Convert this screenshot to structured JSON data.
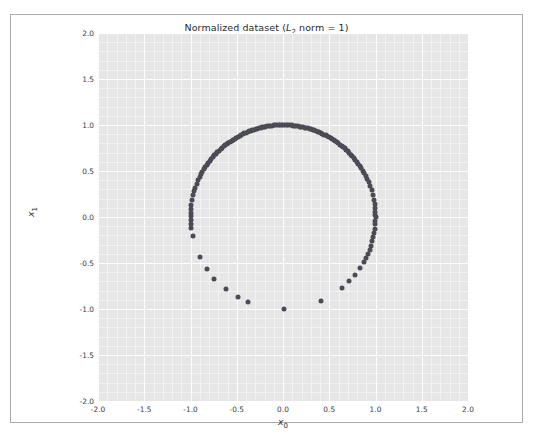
{
  "figure": {
    "background_color": "#ffffff",
    "border_color": "#aaaaac",
    "width": 533,
    "height": 433
  },
  "chart_data": {
    "type": "scatter",
    "title": "Normalized dataset (L2 norm = 1)",
    "title_parts": {
      "prefix": "Normalized dataset (",
      "italic_symbol": "L",
      "subscript": "2",
      "suffix": " norm = 1)"
    },
    "xlabel": "x0",
    "xlabel_parts": {
      "italic_symbol": "x",
      "subscript": "0"
    },
    "ylabel": "x1",
    "ylabel_parts": {
      "italic_symbol": "x",
      "subscript": "1"
    },
    "xlim": [
      -2.0,
      2.0
    ],
    "ylim": [
      -2.0,
      2.0
    ],
    "xticks": [
      -2.0,
      -1.5,
      -1.0,
      -0.5,
      0.0,
      0.5,
      1.0,
      1.5,
      2.0
    ],
    "yticks": [
      -2.0,
      -1.5,
      -1.0,
      -0.5,
      0.0,
      0.5,
      1.0,
      1.5,
      2.0
    ],
    "xtick_labels": [
      "-2.0",
      "-1.5",
      "-1.0",
      "-0.5",
      "0.0",
      "0.5",
      "1.0",
      "1.5",
      "2.0"
    ],
    "ytick_labels": [
      "-2.0",
      "-1.5",
      "-1.0",
      "-0.5",
      "0.0",
      "0.5",
      "1.0",
      "1.5",
      "2.0"
    ],
    "grid": true,
    "grid_color": "#ffffff",
    "minor_grid": true,
    "minor_grid_color": "#f2f2f2",
    "axes_facecolor": "#e6e6e6",
    "legend": null,
    "marker_color": "#4b4b55",
    "marker_size": 5,
    "aspect": "equal",
    "points": [
      [
        0.0043,
        1.0
      ],
      [
        0.0218,
        0.9998
      ],
      [
        0.0395,
        0.9992
      ],
      [
        0.0571,
        0.9984
      ],
      [
        0.0749,
        0.9972
      ],
      [
        0.0925,
        0.9957
      ],
      [
        0.1102,
        0.9939
      ],
      [
        0.1279,
        0.9918
      ],
      [
        -0.0131,
        0.9999
      ],
      [
        -0.0306,
        0.9995
      ],
      [
        -0.0483,
        0.9988
      ],
      [
        -0.066,
        0.9978
      ],
      [
        -0.0837,
        0.9965
      ],
      [
        -0.1013,
        0.9949
      ],
      [
        -0.119,
        0.9929
      ],
      [
        -0.1367,
        0.9906
      ],
      [
        0.1455,
        0.9894
      ],
      [
        0.1632,
        0.9866
      ],
      [
        0.1808,
        0.9835
      ],
      [
        0.1985,
        0.9801
      ],
      [
        0.2161,
        0.9764
      ],
      [
        0.2338,
        0.9723
      ],
      [
        0.2514,
        0.9679
      ],
      [
        0.269,
        0.9632
      ],
      [
        -0.1543,
        0.988
      ],
      [
        -0.172,
        0.9851
      ],
      [
        -0.1896,
        0.9819
      ],
      [
        -0.2073,
        0.9783
      ],
      [
        -0.2249,
        0.9744
      ],
      [
        -0.2425,
        0.9702
      ],
      [
        -0.2601,
        0.9656
      ],
      [
        -0.2777,
        0.9607
      ],
      [
        0.2866,
        0.958
      ],
      [
        0.3042,
        0.9526
      ],
      [
        0.3217,
        0.9469
      ],
      [
        0.3393,
        0.9407
      ],
      [
        0.3568,
        0.9342
      ],
      [
        0.3743,
        0.9273
      ],
      [
        0.3918,
        0.92
      ],
      [
        0.4093,
        0.9124
      ],
      [
        -0.2953,
        0.9554
      ],
      [
        -0.3129,
        0.9498
      ],
      [
        -0.3305,
        0.9438
      ],
      [
        -0.348,
        0.9375
      ],
      [
        -0.3655,
        0.9308
      ],
      [
        -0.383,
        0.9238
      ],
      [
        -0.4005,
        0.9163
      ],
      [
        -0.418,
        0.9085
      ],
      [
        0.4267,
        0.9044
      ],
      [
        0.4441,
        0.896
      ],
      [
        0.4615,
        0.8871
      ],
      [
        0.4789,
        0.8779
      ],
      [
        0.4962,
        0.8682
      ],
      [
        0.5135,
        0.8581
      ],
      [
        0.5308,
        0.8475
      ],
      [
        0.548,
        0.8365
      ],
      [
        -0.4354,
        0.9003
      ],
      [
        -0.4528,
        0.8916
      ],
      [
        -0.4701,
        0.8826
      ],
      [
        -0.4874,
        0.8732
      ],
      [
        -0.5047,
        0.8633
      ],
      [
        -0.5219,
        0.853
      ],
      [
        -0.5391,
        0.8423
      ],
      [
        -0.5563,
        0.8311
      ],
      [
        0.5652,
        0.825
      ],
      [
        0.5823,
        0.813
      ],
      [
        0.5994,
        0.8005
      ],
      [
        0.6164,
        0.7875
      ],
      [
        0.6334,
        0.7739
      ],
      [
        0.6503,
        0.7597
      ],
      [
        0.6672,
        0.745
      ],
      [
        0.684,
        0.7295
      ],
      [
        -0.5734,
        0.8192
      ],
      [
        -0.5905,
        0.807
      ],
      [
        -0.6075,
        0.7943
      ],
      [
        -0.6245,
        0.781
      ],
      [
        -0.6414,
        0.7671
      ],
      [
        -0.6583,
        0.7528
      ],
      [
        -0.6751,
        0.7377
      ],
      [
        -0.6918,
        0.7221
      ],
      [
        0.7008,
        0.7134
      ],
      [
        0.7175,
        0.6966
      ],
      [
        0.7341,
        0.679
      ],
      [
        0.7506,
        0.6608
      ],
      [
        0.7671,
        0.6416
      ],
      [
        0.7835,
        0.6214
      ],
      [
        0.7998,
        0.6003
      ],
      [
        0.816,
        0.5781
      ],
      [
        -0.7085,
        0.7057
      ],
      [
        -0.7251,
        0.6887
      ],
      [
        -0.7417,
        0.6707
      ],
      [
        -0.7582,
        0.652
      ],
      [
        -0.7746,
        0.6324
      ],
      [
        -0.7909,
        0.612
      ],
      [
        -0.8071,
        0.5904
      ],
      [
        -0.8232,
        0.5678
      ],
      [
        0.8322,
        0.5545
      ],
      [
        0.8483,
        0.5295
      ],
      [
        0.8643,
        0.5029
      ],
      [
        0.8801,
        0.4748
      ],
      [
        0.8958,
        0.4444
      ],
      [
        0.9114,
        0.4115
      ],
      [
        0.9268,
        0.3755
      ],
      [
        0.942,
        0.3356
      ],
      [
        -0.8393,
        0.5437
      ],
      [
        -0.8552,
        0.5183
      ],
      [
        -0.871,
        0.4913
      ],
      [
        -0.8867,
        0.4624
      ],
      [
        -0.9022,
        0.4313
      ],
      [
        -0.9175,
        0.3977
      ],
      [
        -0.9327,
        0.3607
      ],
      [
        -0.9477,
        0.3192
      ],
      [
        0.9571,
        0.2898
      ],
      [
        0.971,
        0.2391
      ],
      [
        0.9823,
        0.1873
      ],
      [
        0.9905,
        0.1377
      ],
      [
        0.9956,
        0.0935
      ],
      [
        0.9985,
        0.0549
      ],
      [
        0.9997,
        0.0245
      ],
      [
        1.0,
        -0.0051
      ],
      [
        -0.9583,
        0.2857
      ],
      [
        -0.9712,
        0.2383
      ],
      [
        -0.9822,
        0.1879
      ],
      [
        -0.9908,
        0.1352
      ],
      [
        -0.9962,
        0.0875
      ],
      [
        -0.999,
        0.0451
      ],
      [
        -0.9999,
        0.0122
      ],
      [
        -0.9994,
        -0.0347
      ],
      [
        0.9992,
        -0.0398
      ],
      [
        0.9968,
        -0.0802
      ],
      [
        0.9921,
        -0.1254
      ],
      [
        0.9851,
        -0.1721
      ],
      [
        0.9758,
        -0.2187
      ],
      [
        0.9644,
        -0.2645
      ],
      [
        0.9508,
        -0.3098
      ],
      [
        0.9351,
        -0.3544
      ],
      [
        0.9172,
        -0.3985
      ],
      [
        0.8971,
        -0.4418
      ],
      [
        0.8748,
        -0.4845
      ],
      [
        -0.9972,
        -0.0744
      ],
      [
        -0.9929,
        -0.1188
      ],
      [
        -0.9776,
        -0.2105
      ],
      [
        -0.8981,
        -0.4398
      ],
      [
        -0.8221,
        -0.5694
      ],
      [
        -0.7431,
        -0.6692
      ],
      [
        -0.6176,
        -0.7865
      ],
      [
        -0.4858,
        -0.8741
      ],
      [
        -0.3741,
        -0.9274
      ],
      [
        0.0112,
        -0.9999
      ],
      [
        0.416,
        -0.9094
      ],
      [
        0.6398,
        -0.7685
      ],
      [
        0.7165,
        -0.6976
      ],
      [
        0.7783,
        -0.6279
      ],
      [
        0.832,
        -0.5548
      ]
    ]
  }
}
